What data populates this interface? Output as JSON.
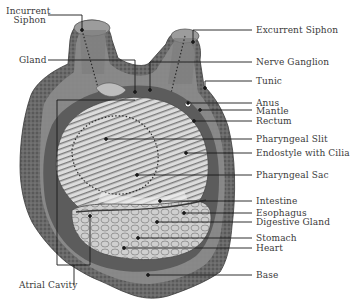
{
  "diagram": {
    "labels_left": [
      {
        "id": "incurrent-siphon",
        "lines": [
          "Incurrent",
          "Siphon"
        ]
      },
      {
        "id": "gland",
        "text": "Gland"
      },
      {
        "id": "atrial-cavity",
        "text": "Atrial Cavity"
      }
    ],
    "labels_right": [
      {
        "id": "excurrent-siphon",
        "text": "Excurrent Siphon"
      },
      {
        "id": "nerve-ganglion",
        "text": "Nerve Ganglion"
      },
      {
        "id": "tunic",
        "text": "Tunic"
      },
      {
        "id": "anus",
        "text": "Anus"
      },
      {
        "id": "mantle",
        "text": "Mantle"
      },
      {
        "id": "rectum",
        "text": "Rectum"
      },
      {
        "id": "pharyngeal-slit",
        "text": "Pharyngeal Slit"
      },
      {
        "id": "endostyle-with-cilia",
        "text": "Endostyle with Cilia"
      },
      {
        "id": "pharyngeal-sac",
        "text": "Pharyngeal Sac"
      },
      {
        "id": "intestine",
        "text": "Intestine"
      },
      {
        "id": "esophagus",
        "text": "Esophagus"
      },
      {
        "id": "digestive-gland",
        "text": "Digestive Gland"
      },
      {
        "id": "stomach",
        "text": "Stomach"
      },
      {
        "id": "heart",
        "text": "Heart"
      },
      {
        "id": "base",
        "text": "Base"
      }
    ],
    "colors": {
      "tunic_dark": "#5a5a5a",
      "tunic_mid": "#8a8a8a",
      "tunic_light": "#a8a8a8",
      "mantle_band": "#6e6e6e",
      "pharynx_fill": "#d8d8d8",
      "gut_fill": "#c4c4c4",
      "leader_line": "#1a1a1a",
      "label_text": "#3a3a3a"
    }
  }
}
